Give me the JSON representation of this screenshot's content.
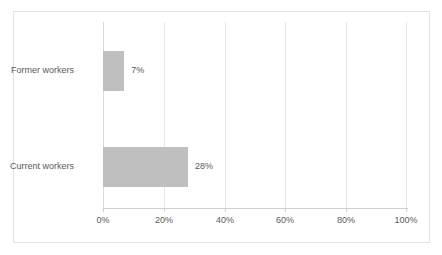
{
  "chart_data": {
    "type": "bar",
    "orientation": "horizontal",
    "title": "",
    "subtitle": "",
    "xlabel": "",
    "ylabel": "",
    "categories": [
      "Former workers",
      "Current workers"
    ],
    "values": [
      7,
      28
    ],
    "value_labels": [
      "7%",
      "28%"
    ],
    "xlim": [
      0,
      100
    ],
    "xticks": [
      0,
      20,
      40,
      60,
      80,
      100
    ],
    "xtick_labels": [
      "0%",
      "20%",
      "40%",
      "60%",
      "80%",
      "100%"
    ],
    "grid": true,
    "grid_axis": "x",
    "legend": false,
    "legend_position": "none",
    "series": [
      {
        "name": "",
        "values": [
          7,
          28
        ]
      }
    ]
  },
  "style": {
    "bar_color": "#bfbfbf",
    "text_color": "#595959",
    "gridline_color": "#e6e6e6",
    "axis_color": "#d0d0d0",
    "frame_border_color": "#e2e2e2",
    "background": "#ffffff"
  }
}
